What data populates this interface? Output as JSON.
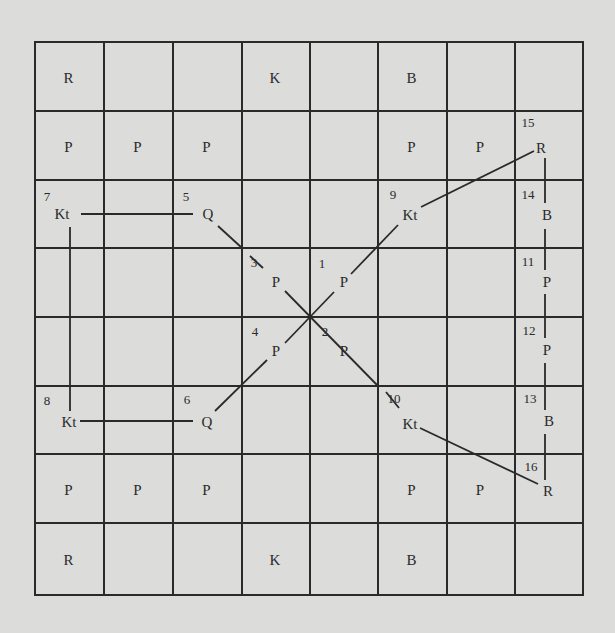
{
  "diagram": {
    "type": "chessboard-move-diagram",
    "grid": {
      "rows": 8,
      "cols": 8
    },
    "colors": {
      "paper": "#dcdcda",
      "ink": "#2a2a2a"
    },
    "pieces": [
      {
        "label": "R",
        "col": 0,
        "row": 0
      },
      {
        "label": "K",
        "col": 3,
        "row": 0
      },
      {
        "label": "B",
        "col": 5,
        "row": 0
      },
      {
        "label": "P",
        "col": 0,
        "row": 1
      },
      {
        "label": "P",
        "col": 1,
        "row": 1
      },
      {
        "label": "P",
        "col": 2,
        "row": 1
      },
      {
        "label": "P",
        "col": 5,
        "row": 1
      },
      {
        "label": "P",
        "col": 6,
        "row": 1
      },
      {
        "label": "R",
        "x": 541,
        "y": 148,
        "move": 15
      },
      {
        "label": "Kt",
        "x": 62,
        "y": 214,
        "move": 7
      },
      {
        "label": "Q",
        "x": 208,
        "y": 214,
        "move": 5
      },
      {
        "label": "Kt",
        "x": 410,
        "y": 215,
        "move": 9
      },
      {
        "label": "B",
        "x": 547,
        "y": 215,
        "move": 14
      },
      {
        "label": "P",
        "x": 276,
        "y": 282,
        "move": 3
      },
      {
        "label": "P",
        "x": 344,
        "y": 282,
        "move": 1
      },
      {
        "label": "P",
        "x": 547,
        "y": 282,
        "move": 11
      },
      {
        "label": "P",
        "x": 276,
        "y": 351,
        "move": 4
      },
      {
        "label": "P",
        "x": 344,
        "y": 351,
        "move": 2
      },
      {
        "label": "P",
        "x": 547,
        "y": 350,
        "move": 12
      },
      {
        "label": "Kt",
        "x": 69,
        "y": 422,
        "move": 8
      },
      {
        "label": "Q",
        "x": 207,
        "y": 422,
        "move": 6
      },
      {
        "label": "Kt",
        "x": 410,
        "y": 424,
        "move": 10
      },
      {
        "label": "B",
        "x": 549,
        "y": 421,
        "move": 13
      },
      {
        "label": "R",
        "x": 548,
        "y": 491,
        "move": 16
      },
      {
        "label": "P",
        "col": 0,
        "row": 6
      },
      {
        "label": "P",
        "col": 1,
        "row": 6
      },
      {
        "label": "P",
        "col": 2,
        "row": 6
      },
      {
        "label": "P",
        "col": 5,
        "row": 6
      },
      {
        "label": "P",
        "col": 6,
        "row": 6
      },
      {
        "label": "R",
        "col": 0,
        "row": 7
      },
      {
        "label": "K",
        "col": 3,
        "row": 7
      },
      {
        "label": "B",
        "col": 5,
        "row": 7
      }
    ],
    "move_numbers": [
      {
        "label": "1",
        "x": 322,
        "y": 263
      },
      {
        "label": "2",
        "x": 325,
        "y": 331
      },
      {
        "label": "3",
        "x": 254,
        "y": 262
      },
      {
        "label": "4",
        "x": 255,
        "y": 331
      },
      {
        "label": "5",
        "x": 186,
        "y": 196
      },
      {
        "label": "6",
        "x": 187,
        "y": 399
      },
      {
        "label": "7",
        "x": 47,
        "y": 196
      },
      {
        "label": "8",
        "x": 47,
        "y": 400
      },
      {
        "label": "9",
        "x": 393,
        "y": 194
      },
      {
        "label": "10",
        "x": 394,
        "y": 398
      },
      {
        "label": "11",
        "x": 528,
        "y": 261
      },
      {
        "label": "12",
        "x": 529,
        "y": 330
      },
      {
        "label": "13",
        "x": 530,
        "y": 398
      },
      {
        "label": "14",
        "x": 528,
        "y": 194
      },
      {
        "label": "15",
        "x": 528,
        "y": 122
      },
      {
        "label": "16",
        "x": 531,
        "y": 466
      }
    ],
    "lines": [
      {
        "x1": 81,
        "y1": 214,
        "x2": 193,
        "y2": 214
      },
      {
        "x1": 70,
        "y1": 227,
        "x2": 70,
        "y2": 411
      },
      {
        "x1": 80,
        "y1": 421,
        "x2": 193,
        "y2": 421
      },
      {
        "x1": 218,
        "y1": 226,
        "x2": 242,
        "y2": 248
      },
      {
        "x1": 250,
        "y1": 256,
        "x2": 263,
        "y2": 268
      },
      {
        "x1": 285,
        "y1": 291,
        "x2": 378,
        "y2": 386
      },
      {
        "x1": 386,
        "y1": 392,
        "x2": 399,
        "y2": 408
      },
      {
        "x1": 420,
        "y1": 428,
        "x2": 538,
        "y2": 484
      },
      {
        "x1": 215,
        "y1": 411,
        "x2": 267,
        "y2": 360
      },
      {
        "x1": 285,
        "y1": 343,
        "x2": 334,
        "y2": 292
      },
      {
        "x1": 351,
        "y1": 274,
        "x2": 398,
        "y2": 225
      },
      {
        "x1": 421,
        "y1": 207,
        "x2": 534,
        "y2": 151
      },
      {
        "x1": 545,
        "y1": 158,
        "x2": 545,
        "y2": 203
      },
      {
        "x1": 545,
        "y1": 229,
        "x2": 545,
        "y2": 270
      },
      {
        "x1": 545,
        "y1": 294,
        "x2": 545,
        "y2": 338
      },
      {
        "x1": 545,
        "y1": 363,
        "x2": 545,
        "y2": 410
      },
      {
        "x1": 545,
        "y1": 434,
        "x2": 545,
        "y2": 480
      }
    ]
  }
}
